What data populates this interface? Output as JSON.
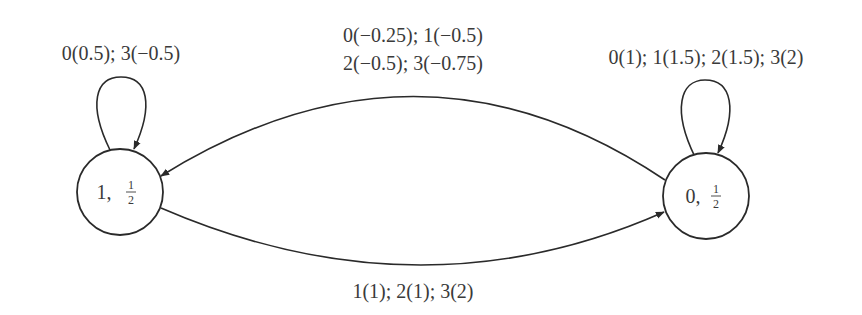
{
  "diagram": {
    "type": "state-transition-graph",
    "nodes": [
      {
        "id": "state-1",
        "state": "1",
        "separator": ",",
        "prob_num": "1",
        "prob_den": "2"
      },
      {
        "id": "state-0",
        "state": "0",
        "separator": ",",
        "prob_num": "1",
        "prob_den": "2"
      }
    ],
    "edges": {
      "self_loop_1": {
        "from": "1",
        "to": "1",
        "label": "0(0.5); 3(−0.5)"
      },
      "self_loop_0": {
        "from": "0",
        "to": "0",
        "label": "0(1); 1(1.5); 2(1.5); 3(2)"
      },
      "edge_0_to_1": {
        "from": "0",
        "to": "1",
        "label_line1": "0(−0.25); 1(−0.5)",
        "label_line2": "2(−0.5); 3(−0.75)"
      },
      "edge_1_to_0": {
        "from": "1",
        "to": "0",
        "label": "1(1); 2(1); 3(2)"
      }
    }
  }
}
